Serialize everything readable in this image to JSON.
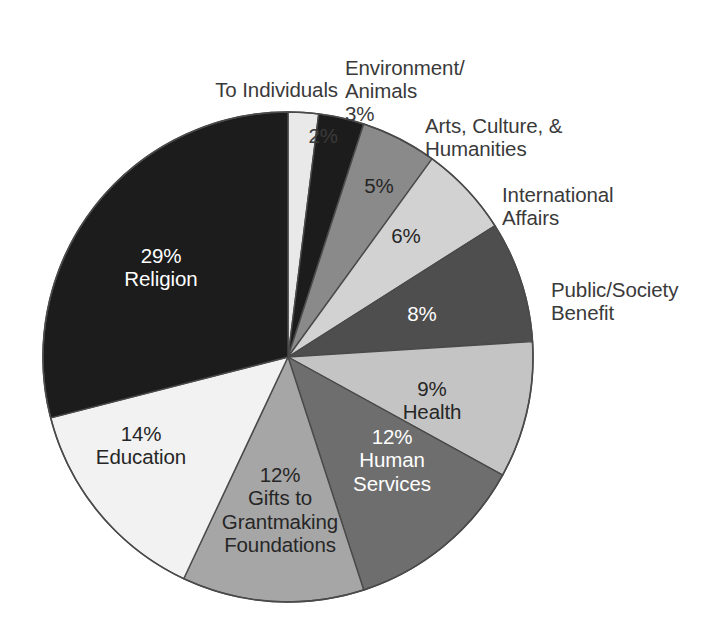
{
  "chart_data": {
    "type": "pie",
    "title": "",
    "subtitle": "",
    "xlabel": "",
    "ylabel": "",
    "legend_position": "none",
    "grid": false,
    "value_unit": "%",
    "total": 100,
    "categories": [
      "To Individuals",
      "Environment/Animals",
      "Arts, Culture, & Humanities",
      "International Affairs",
      "Public/Society Benefit",
      "Health",
      "Human Services",
      "Gifts to Grantmaking Foundations",
      "Education",
      "Religion"
    ],
    "values": [
      2,
      3,
      5,
      6,
      8,
      9,
      12,
      12,
      14,
      29
    ],
    "slices": [
      {
        "label": "To Individuals",
        "value": 2,
        "pct_text": "2%",
        "color": "#e9e9e9",
        "text_color": "#3a3a3a",
        "label_placement": "outside"
      },
      {
        "label": "Environment/\nAnimals",
        "value": 3,
        "pct_text": "3%",
        "color": "#1c1c1c",
        "text_color": "#3a3a3a",
        "label_placement": "outside"
      },
      {
        "label": "Arts, Culture, &\nHumanities",
        "value": 5,
        "pct_text": "5%",
        "color": "#8a8a8a",
        "text_color": "#3a3a3a",
        "label_placement": "outside"
      },
      {
        "label": "International\nAffairs",
        "value": 6,
        "pct_text": "6%",
        "color": "#d2d2d2",
        "text_color": "#3a3a3a",
        "label_placement": "outside"
      },
      {
        "label": "Public/Society\nBenefit",
        "value": 8,
        "pct_text": "8%",
        "color": "#4e4e4e",
        "text_color": "#ffffff",
        "label_placement": "outside"
      },
      {
        "label": "Health",
        "value": 9,
        "pct_text": "9%",
        "color": "#c4c4c4",
        "text_color": "#262626",
        "label_placement": "inside"
      },
      {
        "label": "Human\nServices",
        "value": 12,
        "pct_text": "12%",
        "color": "#6e6e6e",
        "text_color": "#ffffff",
        "label_placement": "inside"
      },
      {
        "label": "Gifts to\nGrantmaking\nFoundations",
        "value": 12,
        "pct_text": "12%",
        "color": "#a6a6a6",
        "text_color": "#262626",
        "label_placement": "inside"
      },
      {
        "label": "Education",
        "value": 14,
        "pct_text": "14%",
        "color": "#f2f2f2",
        "text_color": "#262626",
        "label_placement": "inside"
      },
      {
        "label": "Religion",
        "value": 29,
        "pct_text": "29%",
        "color": "#1c1c1c",
        "text_color": "#ffffff",
        "label_placement": "inside"
      }
    ],
    "geometry": {
      "center_x": 288,
      "center_y": 357,
      "radius": 245,
      "start_angle_deg": 0,
      "direction": "clockwise"
    }
  },
  "external_labels": {
    "to_individuals": {
      "name": "To Individuals",
      "pct": "2%"
    },
    "environment_animals": {
      "name": "Environment/\nAnimals",
      "pct": "3%"
    },
    "arts_culture_humanities": {
      "name": "Arts, Culture, &\nHumanities",
      "pct": "5%"
    },
    "international_affairs": {
      "name": "International\nAffairs",
      "pct": "6%"
    },
    "public_society_benefit": {
      "name": "Public/Society\nBenefit",
      "pct": "8%"
    }
  },
  "internal_labels": {
    "religion": "29%\nReligion",
    "education": "14%\nEducation",
    "gifts": "12%\nGifts to\nGrantmaking\nFoundations",
    "human_services": "12%\nHuman\nServices",
    "health": "9%\nHealth",
    "public_benefit_pct": "8%",
    "international_pct": "6%",
    "arts_pct": "5%"
  },
  "colors": {
    "background": "#ffffff",
    "outline": "#4a4a4a",
    "text_dark": "#3a3a3a",
    "text_light": "#ffffff"
  }
}
